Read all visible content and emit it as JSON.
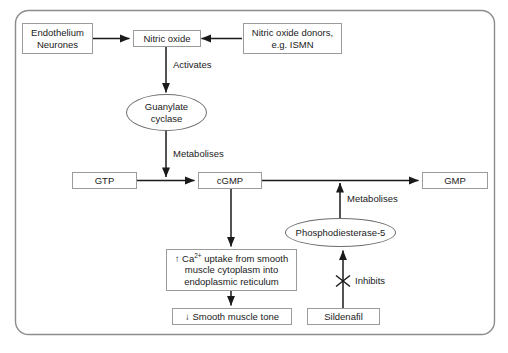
{
  "diagram": {
    "background_color": "#ffffff",
    "border_color": "#8c8c8c",
    "box_border_color": "#9b9b9b",
    "ellipse_border_color": "#6d6d6d",
    "arrow_color": "#1a1a1a",
    "text_color": "#1a1a1a"
  },
  "nodes": {
    "endothelium_neurones": {
      "line1": "Endothelium",
      "line2": "Neurones"
    },
    "nitric_oxide": {
      "label": "Nitric oxide"
    },
    "no_donors": {
      "line1": "Nitric oxide donors,",
      "line2": "e.g. ISMN"
    },
    "guanylate_cyclase": {
      "line1": "Guanylate",
      "line2": "cyclase"
    },
    "gtp": {
      "label": "GTP"
    },
    "cgmp": {
      "label": "cGMP"
    },
    "gmp": {
      "label": "GMP"
    },
    "phosphodiesterase5": {
      "label": "Phosphodiesterase-5"
    },
    "calcium_uptake": {
      "line1_pre": "↑ Ca",
      "line1_sup": "2+",
      "line1_post": " uptake from smooth",
      "line2": "muscle cytoplasm into",
      "line3": "endoplasmic reticulum"
    },
    "smooth_muscle_tone": {
      "label": "↓ Smooth muscle tone"
    },
    "sildenafil": {
      "label": "Sildenafil"
    }
  },
  "edge_labels": {
    "activates": "Activates",
    "metabolises_cyclase": "Metabolises",
    "metabolises_pde5": "Metabolises",
    "inhibits": "Inhibits"
  }
}
